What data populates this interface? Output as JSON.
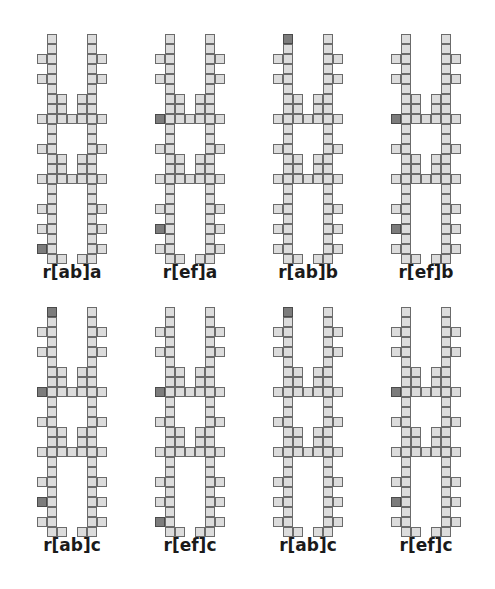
{
  "page": {
    "background_color": "#ffffff",
    "width": 495,
    "height": 589,
    "cell_size": 10,
    "colors": {
      "cell_fill_light": "#dcdcdc",
      "cell_fill_dark": "#7c7c7c",
      "cell_stroke": "#6b6b6b",
      "caption_text": "#1a1a1a"
    }
  },
  "layout": {
    "rows": 2,
    "columns": 4,
    "column_x": [
      22,
      140,
      258,
      376
    ],
    "row_y": [
      34,
      307
    ],
    "caption_y": [
      262,
      535
    ],
    "column_width": 100
  },
  "legend": {
    "light_cell_meaning": "open site",
    "dark_cell_meaning": "marked site"
  },
  "figures": [
    {
      "id": "fig-1",
      "caption": "r[ab]a",
      "row": 0,
      "column": 0,
      "dark_cells": [
        [
          0,
          21
        ],
        [
          8,
          8
        ],
        [
          8,
          19
        ]
      ]
    },
    {
      "id": "fig-2",
      "caption": "r[ef]a",
      "row": 0,
      "column": 1,
      "dark_cells": [
        [
          0,
          8
        ],
        [
          0,
          19
        ],
        [
          8,
          21
        ]
      ]
    },
    {
      "id": "fig-3",
      "caption": "r[ab]b",
      "row": 0,
      "column": 2,
      "dark_cells": [
        [
          1,
          0
        ],
        [
          8,
          8
        ],
        [
          8,
          19
        ]
      ]
    },
    {
      "id": "fig-4",
      "caption": "r[ef]b",
      "row": 0,
      "column": 3,
      "dark_cells": [
        [
          8,
          0
        ],
        [
          0,
          8
        ],
        [
          0,
          19
        ]
      ]
    },
    {
      "id": "fig-5",
      "caption": "r[ab]c",
      "row": 1,
      "column": 0,
      "dark_cells": [
        [
          1,
          0
        ],
        [
          0,
          8
        ],
        [
          8,
          8
        ],
        [
          0,
          19
        ],
        [
          8,
          21
        ]
      ]
    },
    {
      "id": "fig-6",
      "caption": "r[ef]c",
      "row": 1,
      "column": 1,
      "dark_cells": [
        [
          8,
          0
        ],
        [
          0,
          8
        ],
        [
          8,
          8
        ],
        [
          8,
          19
        ],
        [
          0,
          21
        ]
      ]
    },
    {
      "id": "fig-7",
      "caption": "r[ab]c",
      "row": 1,
      "column": 2,
      "dark_cells": [
        [
          1,
          0
        ],
        [
          8,
          8
        ],
        [
          8,
          19
        ]
      ]
    },
    {
      "id": "fig-8",
      "caption": "r[ef]c",
      "row": 1,
      "column": 3,
      "dark_cells": [
        [
          8,
          0
        ],
        [
          0,
          8
        ],
        [
          0,
          19
        ]
      ]
    }
  ],
  "shape_template": {
    "description": "Two vertical rails with rungs and single-cell side tabs.",
    "rail_left_col": 1,
    "rail_right_col": 5,
    "rows_total": 23,
    "rail_cells": "columns 1 and 5 filled for rows 0..22",
    "tab_rows_left": [
      2,
      4,
      8,
      11,
      14,
      17,
      19,
      21
    ],
    "tab_rows_right": [
      2,
      4,
      8,
      11,
      14,
      17,
      19,
      21
    ],
    "rung_rows": [
      8,
      14
    ],
    "inner_stub_rows": [
      6,
      7,
      12,
      13
    ],
    "bottom_foot_row": 22
  }
}
